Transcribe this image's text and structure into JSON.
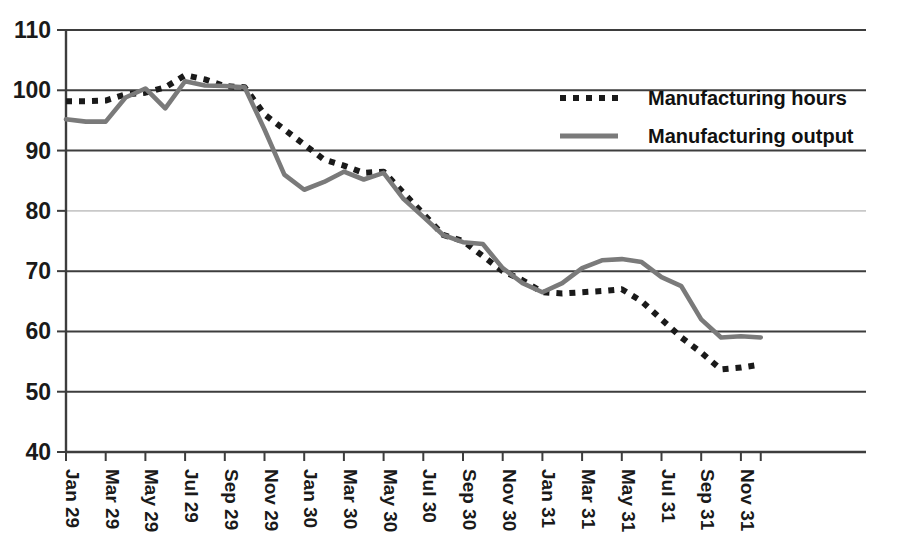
{
  "chart_data": {
    "type": "line",
    "title": "",
    "subtitle": "",
    "xlabel": "",
    "ylabel": "",
    "ylim": [
      40,
      110
    ],
    "ytick_step": 10,
    "grid": true,
    "legend_position": "top-right",
    "y_ticks": [
      "110",
      "100",
      "90",
      "80",
      "70",
      "60",
      "50",
      "40"
    ],
    "x_tick_labels": [
      "Jan 29",
      "Mar 29",
      "May 29",
      "Jul 29",
      "Sep 29",
      "Nov 29",
      "Jan 30",
      "Mar 30",
      "May 30",
      "Jul 30",
      "Sep 30",
      "Nov 30",
      "Jan 31",
      "Mar 31",
      "May 31",
      "Jul 31",
      "Sep 31",
      "Nov 31"
    ],
    "x": [
      "Jan 29",
      "Feb 29",
      "Mar 29",
      "Apr 29",
      "May 29",
      "Jun 29",
      "Jul 29",
      "Aug 29",
      "Sep 29",
      "Oct 29",
      "Nov 29",
      "Dec 29",
      "Jan 30",
      "Feb 30",
      "Mar 30",
      "Apr 30",
      "May 30",
      "Jun 30",
      "Jul 30",
      "Aug 30",
      "Sep 30",
      "Oct 30",
      "Nov 30",
      "Dec 30",
      "Jan 31",
      "Feb 31",
      "Mar 31",
      "Apr 31",
      "May 31",
      "Jun 31",
      "Jul 31",
      "Aug 31",
      "Sep 31",
      "Oct 31",
      "Nov 31",
      "Dec 31"
    ],
    "series": [
      {
        "name": "Manufacturing hours",
        "style": "dotted",
        "color": "#1a1a1a",
        "values": [
          98.2,
          98.2,
          98.3,
          99.3,
          99.6,
          100.5,
          102.5,
          101.8,
          100.7,
          100.5,
          96.0,
          93.5,
          91.0,
          88.5,
          87.5,
          86.3,
          86.5,
          83.0,
          79.5,
          76.0,
          75.0,
          72.5,
          70.0,
          68.5,
          66.5,
          66.3,
          66.5,
          66.7,
          67.0,
          65.0,
          62.0,
          59.0,
          56.5,
          53.7,
          54.0,
          54.5
        ]
      },
      {
        "name": "Manufacturing output",
        "style": "solid",
        "color": "#7a7a7a",
        "values": [
          95.2,
          94.8,
          94.8,
          98.8,
          100.3,
          97.0,
          101.5,
          100.8,
          100.7,
          100.5,
          93.5,
          86.0,
          83.5,
          84.8,
          86.5,
          85.2,
          86.3,
          82.0,
          79.0,
          76.0,
          74.8,
          74.5,
          70.5,
          68.0,
          66.5,
          68.0,
          70.5,
          71.8,
          72.0,
          71.5,
          69.0,
          67.5,
          62.0,
          59.0,
          59.2,
          59.0
        ]
      }
    ],
    "legend": [
      {
        "label": "Manufacturing hours",
        "style": "dotted",
        "color": "#1a1a1a"
      },
      {
        "label": "Manufacturing output",
        "style": "solid",
        "color": "#7a7a7a"
      }
    ]
  }
}
